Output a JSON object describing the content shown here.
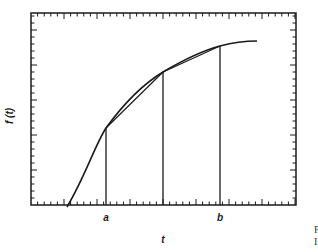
{
  "figure": {
    "ylabel": "f (t)",
    "xlabel": "t",
    "point_a_label": "a",
    "point_b_label": "b",
    "cropped_text_1": "F",
    "cropped_text_2": "I"
  },
  "colors": {
    "ink": "#1a1a1a",
    "background": "#ffffff"
  },
  "chart_data": {
    "type": "line",
    "title": "",
    "xlabel": "t",
    "ylabel": "f (t)",
    "grid": false,
    "legend": null,
    "curve_pixel_points": [
      [
        67,
        207
      ],
      [
        85,
        178
      ],
      [
        106,
        128
      ],
      [
        135,
        97
      ],
      [
        163,
        72
      ],
      [
        192,
        57
      ],
      [
        220,
        46
      ],
      [
        240,
        42
      ],
      [
        257,
        41
      ]
    ],
    "ordinates": [
      {
        "label": "a",
        "x_px": 106,
        "top_px": 128
      },
      {
        "label": "",
        "x_px": 163,
        "top_px": 72
      },
      {
        "label": "b",
        "x_px": 220,
        "top_px": 46
      }
    ],
    "chords": [
      [
        [
          106,
          128
        ],
        [
          163,
          72
        ]
      ],
      [
        [
          163,
          72
        ],
        [
          220,
          46
        ]
      ]
    ],
    "frame_px": {
      "left": 31,
      "top": 13,
      "right": 296,
      "bottom": 205
    },
    "ticks": {
      "x_spacing_px": 6.6,
      "y_spacing_px": 7,
      "major_every": 5
    }
  }
}
